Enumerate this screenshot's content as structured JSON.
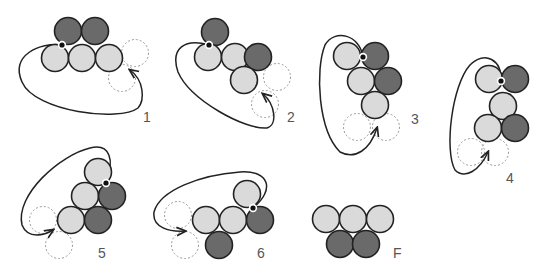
{
  "colors": {
    "light": "#dadada",
    "dark": "#6a6a6a",
    "stroke": "#222222",
    "dashed": "#9a9a9a",
    "label": "#555555"
  },
  "panels": [
    {
      "label": "1",
      "label_pos": [
        143,
        122
      ],
      "circles": [
        {
          "x": 68,
          "y": 31,
          "shade": "dark"
        },
        {
          "x": 95,
          "y": 31,
          "shade": "dark"
        },
        {
          "x": 55,
          "y": 58,
          "shade": "light"
        },
        {
          "x": 82,
          "y": 58,
          "shade": "light"
        },
        {
          "x": 109,
          "y": 58,
          "shade": "light"
        }
      ],
      "ghosts": [
        {
          "x": 135,
          "y": 53
        },
        {
          "x": 122,
          "y": 78
        }
      ],
      "dot": [
        62,
        45
      ],
      "path": "M62,45 C40,42 10,55 22,82 C35,112 120,122 138,108 C145,100 144,80 130,70",
      "arrow": [
        130,
        70
      ]
    },
    {
      "label": "2",
      "label_pos": [
        287,
        122
      ],
      "circles": [
        {
          "x": 215,
          "y": 32,
          "shade": "dark"
        },
        {
          "x": 208,
          "y": 57,
          "shade": "light"
        },
        {
          "x": 235,
          "y": 57,
          "shade": "light"
        },
        {
          "x": 258,
          "y": 57,
          "shade": "dark"
        },
        {
          "x": 244,
          "y": 80,
          "shade": "light"
        }
      ],
      "ghosts": [
        {
          "x": 277,
          "y": 77
        },
        {
          "x": 265,
          "y": 104
        }
      ],
      "dot": [
        209,
        45
      ],
      "path": "M209,45 C185,38 170,48 178,72 C190,100 245,130 267,128 C278,125 275,104 263,94",
      "arrow": [
        263,
        94
      ]
    },
    {
      "label": "3",
      "label_pos": [
        411,
        124
      ],
      "circles": [
        {
          "x": 347,
          "y": 56,
          "shade": "light"
        },
        {
          "x": 375,
          "y": 56,
          "shade": "dark"
        },
        {
          "x": 361,
          "y": 81,
          "shade": "light"
        },
        {
          "x": 388,
          "y": 81,
          "shade": "dark"
        },
        {
          "x": 375,
          "y": 105,
          "shade": "light"
        }
      ],
      "ghosts": [
        {
          "x": 357,
          "y": 127
        },
        {
          "x": 386,
          "y": 127
        }
      ],
      "dot": [
        363,
        57
      ],
      "path": "M363,57 C360,35 335,28 325,45 C315,70 318,130 340,152 C355,160 370,150 377,128",
      "arrow": [
        377,
        128
      ]
    },
    {
      "label": "4",
      "label_pos": [
        506,
        183
      ],
      "circles": [
        {
          "x": 489,
          "y": 79,
          "shade": "light"
        },
        {
          "x": 515,
          "y": 79,
          "shade": "dark"
        },
        {
          "x": 503,
          "y": 106,
          "shade": "light"
        },
        {
          "x": 488,
          "y": 128,
          "shade": "light"
        },
        {
          "x": 515,
          "y": 128,
          "shade": "dark"
        }
      ],
      "ghosts": [
        {
          "x": 471,
          "y": 152
        },
        {
          "x": 495,
          "y": 152
        }
      ],
      "dot": [
        501,
        81
      ],
      "path": "M501,81 C502,60 485,50 470,65 C452,85 444,150 455,170 C465,180 480,170 488,152",
      "arrow": [
        488,
        152
      ]
    },
    {
      "label": "5",
      "label_pos": [
        98,
        258
      ],
      "circles": [
        {
          "x": 98,
          "y": 172,
          "shade": "light"
        },
        {
          "x": 85,
          "y": 196,
          "shade": "light"
        },
        {
          "x": 112,
          "y": 196,
          "shade": "dark"
        },
        {
          "x": 71,
          "y": 220,
          "shade": "light"
        },
        {
          "x": 98,
          "y": 220,
          "shade": "dark"
        }
      ],
      "ghosts": [
        {
          "x": 43,
          "y": 220
        },
        {
          "x": 59,
          "y": 245
        }
      ],
      "dot": [
        106,
        183
      ],
      "path": "M106,183 C115,160 110,143 90,148 C60,155 15,195 22,225 C28,240 45,235 53,230",
      "arrow": [
        53,
        230
      ]
    },
    {
      "label": "6",
      "label_pos": [
        257,
        258
      ],
      "circles": [
        {
          "x": 247,
          "y": 194,
          "shade": "light"
        },
        {
          "x": 206,
          "y": 220,
          "shade": "light"
        },
        {
          "x": 233,
          "y": 220,
          "shade": "light"
        },
        {
          "x": 260,
          "y": 220,
          "shade": "dark"
        },
        {
          "x": 219,
          "y": 245,
          "shade": "dark"
        }
      ],
      "ghosts": [
        {
          "x": 178,
          "y": 215
        },
        {
          "x": 185,
          "y": 245
        }
      ],
      "dot": [
        253,
        208
      ],
      "path": "M253,208 C275,190 270,170 240,172 C200,175 160,190 154,212 C152,228 170,232 185,231",
      "arrow": [
        185,
        231
      ]
    },
    {
      "label": "F",
      "label_pos": [
        393,
        258
      ],
      "circles": [
        {
          "x": 326,
          "y": 219,
          "shade": "light"
        },
        {
          "x": 353,
          "y": 219,
          "shade": "light"
        },
        {
          "x": 380,
          "y": 219,
          "shade": "light"
        },
        {
          "x": 340,
          "y": 244,
          "shade": "dark"
        },
        {
          "x": 366,
          "y": 244,
          "shade": "dark"
        }
      ],
      "ghosts": [],
      "dot": null,
      "path": null,
      "arrow": null
    }
  ]
}
